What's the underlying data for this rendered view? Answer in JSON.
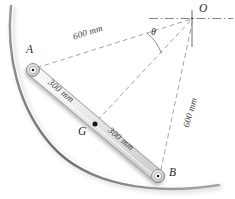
{
  "figure": {
    "background_color": "#ffffff",
    "line_color": "#6f6f6f",
    "rod_fill_color": "#e9e9e9",
    "rod_stroke_color": "#8a8a8a",
    "arc_color": "#808080",
    "text_color": "#2b2b2b"
  },
  "points": {
    "O": {
      "label": "O",
      "x": 192,
      "y": 18,
      "label_x": 199,
      "label_y": 5
    },
    "A": {
      "label": "A",
      "x": 33,
      "y": 70,
      "label_x": 26,
      "label_y": 45
    },
    "B": {
      "label": "B",
      "x": 158,
      "y": 176,
      "label_x": 169,
      "label_y": 167
    },
    "G": {
      "label": "G",
      "x": 95,
      "y": 124,
      "label_x": 78,
      "label_y": 126
    }
  },
  "angle": {
    "symbol": "θ",
    "label_x": 151,
    "label_y": 27
  },
  "dimensions": [
    {
      "id": "oa",
      "text": "600 mm",
      "x": 72,
      "y": 33,
      "rotation": -17.5
    },
    {
      "id": "ag",
      "text": "300 mm",
      "x": 52,
      "y": 78,
      "rotation": 40
    },
    {
      "id": "gb",
      "text": "300 mm",
      "x": 112,
      "y": 126,
      "rotation": 40
    },
    {
      "id": "ob",
      "text": "600 mm",
      "x": 182,
      "y": 126,
      "rotation": -74
    }
  ],
  "icons": {
    "pin_joint": "pin-joint-icon",
    "center_of_mass": "center-of-mass-dot-icon"
  }
}
